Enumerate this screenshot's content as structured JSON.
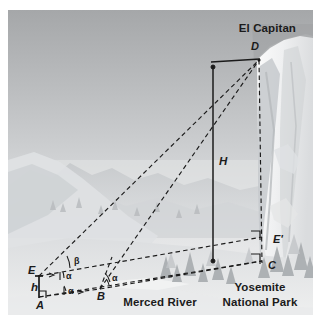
{
  "figure": {
    "canvas": {
      "width": 321,
      "height": 320,
      "inset_left": 8,
      "inset_top": 10,
      "art_width": 305,
      "art_height": 305
    },
    "scene": {
      "sky_top_color": "#a9abad",
      "sky_bottom_color": "#e9eaeb",
      "cliff_color": "#f0f1f2",
      "cliff_shadow_color": "#c3c6c8",
      "ridge_color": "#c9cccf",
      "valley_color": "#dfe1e3",
      "tree_color": "#b0b4b7",
      "line_color": "#1b1b1b"
    },
    "place_labels": [
      {
        "name": "el-capitan",
        "text": "El Capitan",
        "x": 288,
        "y": 22,
        "anchor": "end"
      },
      {
        "name": "merced-river",
        "text": "Merced River",
        "x": 152,
        "y": 296,
        "anchor": "middle"
      },
      {
        "name": "yosemite-line1",
        "text": "Yosemite",
        "x": 252,
        "y": 281,
        "anchor": "middle"
      },
      {
        "name": "yosemite-line2",
        "text": "National Park",
        "x": 252,
        "y": 296,
        "anchor": "middle"
      }
    ],
    "point_labels": [
      {
        "name": "point-a",
        "text": "A",
        "x": 28,
        "y": 299
      },
      {
        "name": "point-b",
        "text": "B",
        "x": 89,
        "y": 290
      },
      {
        "name": "point-e",
        "text": "E",
        "x": 20,
        "y": 264
      },
      {
        "name": "point-c",
        "text": "C",
        "x": 260,
        "y": 259
      },
      {
        "name": "point-e-prime",
        "text": "E'",
        "x": 265,
        "y": 233
      },
      {
        "name": "point-d",
        "text": "D",
        "x": 243,
        "y": 40
      }
    ],
    "measure_labels": [
      {
        "name": "height-h-capital",
        "text": "H",
        "x": 211,
        "y": 155
      },
      {
        "name": "height-h-small",
        "text": "h",
        "x": 23,
        "y": 281
      }
    ],
    "angle_labels": [
      {
        "name": "angle-beta-at-e",
        "text": "β",
        "x": 66,
        "y": 254
      },
      {
        "name": "angle-alpha-at-e-upper",
        "text": "α",
        "x": 61,
        "y": 268
      },
      {
        "name": "angle-alpha-at-e-lower",
        "text": "α",
        "x": 63,
        "y": 282
      },
      {
        "name": "angle-alpha-at-b-upper",
        "text": "α",
        "x": 103,
        "y": 269
      },
      {
        "name": "angle-alpha-at-b-lower",
        "text": "α",
        "x": 103,
        "y": 269
      }
    ],
    "geometry": {
      "points": {
        "A": {
          "x": 31,
          "y": 287
        },
        "B": {
          "x": 92,
          "y": 279
        },
        "E": {
          "x": 31,
          "y": 266
        },
        "C": {
          "x": 254,
          "y": 251
        },
        "Eprime": {
          "x": 254,
          "y": 227
        },
        "D": {
          "x": 251,
          "y": 50
        }
      },
      "dashed_edges": [
        "E-D",
        "B-D",
        "A-B",
        "E-Eprime",
        "A-C",
        "B-C",
        "D-C"
      ],
      "solid_edges": [
        "A-E (h)",
        "H-bar",
        "D-top-tick"
      ]
    }
  }
}
